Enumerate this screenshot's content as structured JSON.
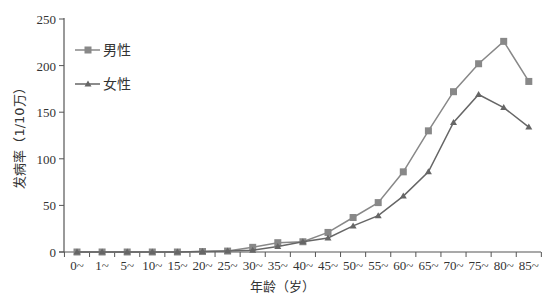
{
  "chart_data": {
    "type": "line",
    "title": "",
    "xlabel": "年龄（岁）",
    "ylabel": "发病率（1/10万）",
    "ylim": [
      0,
      250
    ],
    "yticks": [
      0,
      50,
      100,
      150,
      200,
      250
    ],
    "grid": false,
    "legend_position": "upper-left",
    "categories": [
      "0~",
      "1~",
      "5~",
      "10~",
      "15~",
      "20~",
      "25~",
      "30~",
      "35~",
      "40~",
      "45~",
      "50~",
      "55~",
      "60~",
      "65~",
      "70~",
      "75~",
      "80~",
      "85~"
    ],
    "series": [
      {
        "name": "男性",
        "marker": "square",
        "color": "#888888",
        "values": [
          0,
          0,
          0,
          0,
          0,
          0.5,
          1,
          5,
          10,
          11,
          21,
          37,
          53,
          86,
          130,
          172,
          202,
          226,
          183
        ]
      },
      {
        "name": "女性",
        "marker": "triangle",
        "color": "#666666",
        "values": [
          0,
          0,
          0,
          0,
          0,
          0.5,
          1,
          2,
          6,
          11,
          15,
          28,
          39,
          60,
          86,
          139,
          169,
          155,
          134
        ]
      }
    ]
  },
  "legend": {
    "items": [
      {
        "label": "男性",
        "marker": "square"
      },
      {
        "label": "女性",
        "marker": "triangle"
      }
    ]
  },
  "colors": {
    "axis": "#555555",
    "text": "#333333",
    "male_line": "#888888",
    "female_line": "#666666"
  }
}
